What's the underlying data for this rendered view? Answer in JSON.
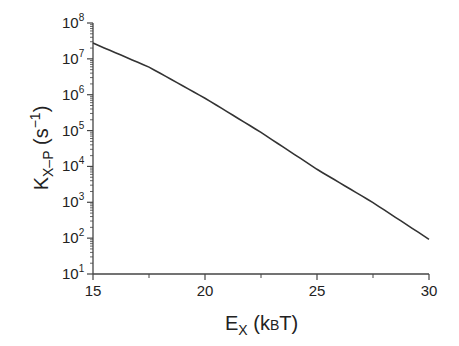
{
  "chart_data": {
    "type": "line",
    "title": "",
    "xlabel": "E_X (kBT)",
    "ylabel": "K_X-P (s^-1)",
    "xlabel_parts": {
      "main": "E",
      "sub": "X",
      "rest": " (k",
      "sub2": "B",
      "rest2": "T)"
    },
    "ylabel_parts": {
      "main": "K",
      "sub": "X–P",
      "rest": " (s",
      "sup": "−1",
      "rest2": ")"
    },
    "xlim": [
      15,
      30
    ],
    "ylim": [
      10,
      100000000
    ],
    "yscale": "log",
    "grid": false,
    "legend": null,
    "x_ticks": [
      15,
      20,
      25,
      30
    ],
    "x_tick_labels": [
      "15",
      "20",
      "25",
      "30"
    ],
    "x_minor_ticks": [
      17.5,
      22.5,
      27.5
    ],
    "y_ticks": [
      1,
      2,
      3,
      4,
      5,
      6,
      7,
      8
    ],
    "y_tick_labels": [
      "10^1",
      "10^2",
      "10^3",
      "10^4",
      "10^5",
      "10^6",
      "10^7",
      "10^8"
    ],
    "series": [
      {
        "name": "K_X-P",
        "color": "#333333",
        "x": [
          15,
          17.5,
          20,
          22.5,
          25,
          27.5,
          30
        ],
        "y": [
          27500000,
          5900000,
          800000,
          89000,
          8300,
          980,
          93
        ]
      }
    ]
  }
}
